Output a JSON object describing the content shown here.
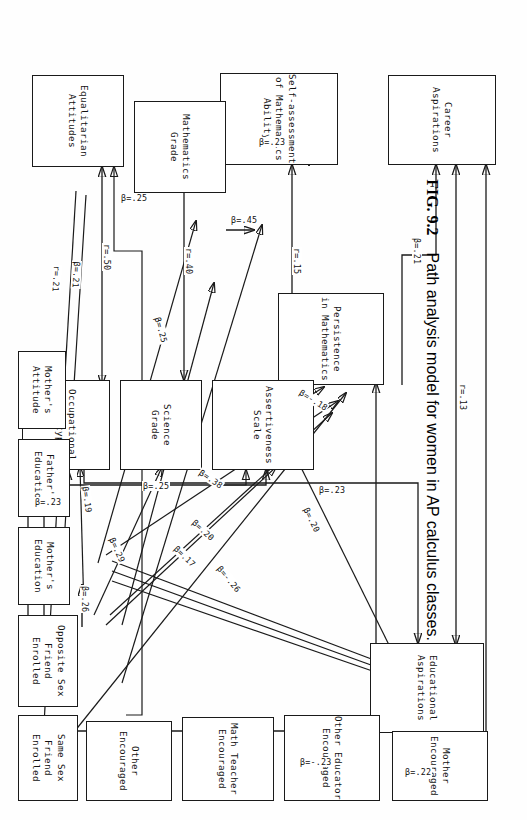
{
  "figure": {
    "number": "FIG. 9.2",
    "caption": "Path analysis model for women in AP calculus classes.",
    "orientation_degrees": 90,
    "diagram_type": "path-analysis-model"
  },
  "nodes": [
    {
      "id": "career_aspirations",
      "label": "Career\nAspirations"
    },
    {
      "id": "educational_aspirations",
      "label": "Educational\nAspirations"
    },
    {
      "id": "persistence_math",
      "label": "Persistence\nin Mathematics"
    },
    {
      "id": "self_assessment",
      "label": "Self-assessment\nof Mathematics\nAbility"
    },
    {
      "id": "assertiveness_scale",
      "label": "Assertiveness\nScale"
    },
    {
      "id": "mathematics_grade",
      "label": "Mathematics\nGrade"
    },
    {
      "id": "science_grade",
      "label": "Science\nGrade"
    },
    {
      "id": "equalitarian_attitudes",
      "label": "Equalitarian\nAttitudes"
    },
    {
      "id": "occupational_stereotyping",
      "label": "Occupational\nStereotyping"
    },
    {
      "id": "mother_encouraged",
      "label": "Mother\nEncouraged"
    },
    {
      "id": "other_educator_encouraged",
      "label": "Other Educator\nEncouraged"
    },
    {
      "id": "math_teacher_encouraged",
      "label": "Math Teacher\nEncouraged"
    },
    {
      "id": "other_encouraged",
      "label": "Other\nEncouraged"
    },
    {
      "id": "same_sex_friend_enrolled",
      "label": "Same Sex Friend\nEnrolled"
    },
    {
      "id": "opposite_sex_friend_enrolled",
      "label": "Opposite Sex\nFriend\nEnrolled"
    },
    {
      "id": "mothers_education",
      "label": "Mother's\nEducation"
    },
    {
      "id": "fathers_education",
      "label": "Father's\nEducation"
    },
    {
      "id": "mothers_attitude",
      "label": "Mother's\nAttitude"
    }
  ],
  "edge_labels": [
    {
      "id": "e_r13",
      "text": "r=.13",
      "from": "educational_aspirations",
      "to": "career_aspirations",
      "kind": "correlation"
    },
    {
      "id": "e_b21",
      "text": "β=.21",
      "from": "persistence_math",
      "to": "career_aspirations",
      "kind": "path"
    },
    {
      "id": "e_b22",
      "text": "β=.22",
      "from": "mother_encouraged",
      "to": "career_aspirations",
      "kind": "path"
    },
    {
      "id": "e_bneg23",
      "text": "β=-.23",
      "from": "mother_encouraged",
      "to": "persistence_math",
      "kind": "path"
    },
    {
      "id": "e_b23a",
      "text": "β=.23",
      "from": "mathematics_grade",
      "to": "self_assessment",
      "kind": "path"
    },
    {
      "id": "e_b45",
      "text": "β=.45",
      "from": "mathematics_grade",
      "to": "self_assessment",
      "kind": "path"
    },
    {
      "id": "e_b23b",
      "text": "β=.23",
      "from": "occupational_stereotyping",
      "to": "educational_aspirations",
      "kind": "path"
    },
    {
      "id": "e_r15",
      "text": "r=.15",
      "from": "assertiveness_scale",
      "to": "self_assessment",
      "kind": "correlation"
    },
    {
      "id": "e_r40",
      "text": "r=.40",
      "from": "science_grade",
      "to": "mathematics_grade",
      "kind": "correlation"
    },
    {
      "id": "e_r50",
      "text": "r=.50",
      "from": "occupational_stereotyping",
      "to": "equalitarian_attitudes",
      "kind": "correlation"
    },
    {
      "id": "e_b38",
      "text": "β=.38",
      "from": "same_sex_friend_enrolled",
      "to": "persistence_math",
      "kind": "path"
    },
    {
      "id": "e_b20a",
      "text": "β=.20",
      "from": "opposite_sex_friend_enrolled",
      "to": "persistence_math",
      "kind": "path"
    },
    {
      "id": "e_b17",
      "text": "β=.17",
      "from": "opposite_sex_friend_enrolled",
      "to": "assertiveness_scale",
      "kind": "path"
    },
    {
      "id": "e_bneg18",
      "text": "β=-.18",
      "from": "assertiveness_scale",
      "to": "persistence_math",
      "kind": "path"
    },
    {
      "id": "e_b20b",
      "text": "β=.20",
      "from": "assertiveness_scale",
      "to": "educational_aspirations",
      "kind": "path"
    },
    {
      "id": "e_bneg26",
      "text": "β=-.26",
      "from": "mothers_attitude",
      "to": "persistence_math",
      "kind": "path"
    },
    {
      "id": "e_b25a",
      "text": "β=.25",
      "from": "same_sex_friend_enrolled",
      "to": "mathematics_grade",
      "kind": "path"
    },
    {
      "id": "e_b25b",
      "text": "β=.25",
      "from": "math_teacher_encouraged",
      "to": "mathematics_grade",
      "kind": "path"
    },
    {
      "id": "e_b29",
      "text": "β=.29",
      "from": "opposite_sex_friend_enrolled",
      "to": "science_grade",
      "kind": "path"
    },
    {
      "id": "e_b21b",
      "text": "β=.21",
      "from": "other_educator_encouraged",
      "to": "equalitarian_attitudes",
      "kind": "path"
    },
    {
      "id": "e_r21",
      "text": "r=.21",
      "from": "equalitarian_attitudes",
      "to": "occupational_stereotyping",
      "kind": "correlation"
    },
    {
      "id": "e_b19",
      "text": "β=.19",
      "from": "opposite_sex_friend_enrolled",
      "to": "occupational_stereotyping",
      "kind": "path"
    },
    {
      "id": "e_b26",
      "text": "β=.26",
      "from": "mothers_education",
      "to": "occupational_stereotyping",
      "kind": "path"
    },
    {
      "id": "e_b25c",
      "text": "β=.25",
      "from": "fathers_education",
      "to": "assertiveness_scale",
      "kind": "path"
    },
    {
      "id": "e_b23c",
      "text": "β=.23",
      "from": "fathers_education",
      "to": "occupational_stereotyping",
      "kind": "path"
    }
  ],
  "style": {
    "ink": "#1a1a1a",
    "paper": "#ffffff"
  }
}
